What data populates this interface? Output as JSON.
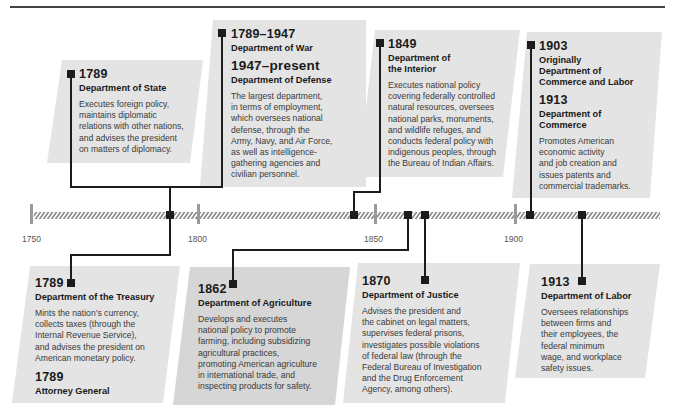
{
  "timeline": {
    "start_year": 1750,
    "ticks": [
      {
        "label": "1750",
        "x": 31
      },
      {
        "label": "1800",
        "x": 198
      },
      {
        "label": "1850",
        "x": 375
      },
      {
        "label": "1900",
        "x": 515
      }
    ],
    "markers": [
      {
        "year": 1789,
        "x": 170
      },
      {
        "year": 1849,
        "x": 354
      },
      {
        "year": 1862,
        "x": 408
      },
      {
        "year": 1870,
        "x": 425
      },
      {
        "year": 1903,
        "x": 530
      },
      {
        "year": 1913,
        "x": 582
      }
    ],
    "colors": {
      "card_light": "#e4e4e4",
      "card_dark": "#d6d6d6",
      "line": "#1c1c1c",
      "tick": "#9a9a9a",
      "hatch": "#8a8a8a"
    }
  },
  "cards": {
    "state": {
      "year": "1789",
      "dept": "Department of State",
      "desc": [
        "Executes foreign policy,",
        "maintains diplomatic",
        "relations with other nations,",
        "and advises the president",
        "on matters of diplomacy."
      ]
    },
    "defense": {
      "year1": "1789–1947",
      "dept1": "Department of War",
      "year2": "1947–present",
      "dept2": "Department of Defense",
      "desc": [
        "The largest department,",
        "in terms of employment,",
        "which oversees national",
        "defense, through the",
        "Army, Navy, and Air Force,",
        "as well as intelligence-",
        "gathering agencies and",
        "civilian personnel."
      ]
    },
    "interior": {
      "year": "1849",
      "dept": [
        "Department of",
        "the Interior"
      ],
      "desc": [
        "Executes national policy",
        "covering federally controlled",
        "natural resources, oversees",
        "national parks, monuments,",
        "and wildlife refuges, and",
        "conducts federal policy with",
        "indigenous peoples, through",
        "the Bureau of Indian Affairs."
      ]
    },
    "commerce": {
      "year1": "1903",
      "dept1": [
        "Originally",
        "Department of",
        "Commerce and Labor"
      ],
      "year2": "1913",
      "dept2": [
        "Department of",
        "Commerce"
      ],
      "desc": [
        "Promotes American",
        "economic activity",
        "and job creation and",
        "issues patents and",
        "commercial trademarks."
      ]
    },
    "treasury": {
      "year": "1789",
      "dept": "Department of the Treasury",
      "desc": [
        "Mints the nation’s currency,",
        "collects taxes (through the",
        "Internal Revenue Service),",
        "and advises the president on",
        "American monetary policy."
      ],
      "year2": "1789",
      "dept2": "Attorney General"
    },
    "agriculture": {
      "year": "1862",
      "dept": "Department of Agriculture",
      "desc": [
        "Develops and executes",
        "national policy to promote",
        "farming, including subsidizing",
        "agricultural practices,",
        "promoting American agriculture",
        "in international trade, and",
        "inspecting products for safety."
      ]
    },
    "justice": {
      "year": "1870",
      "dept": "Department of Justice",
      "desc": [
        "Advises the president and",
        "the cabinet on legal matters,",
        "supervises federal prisons,",
        "investigates possible violations",
        "of federal law (through the",
        "Federal Bureau of Investigation",
        "and the Drug Enforcement",
        "Agency, among others)."
      ]
    },
    "labor": {
      "year": "1913",
      "dept": "Department of Labor",
      "desc": [
        "Oversees relationships",
        "between firms and",
        "their employees, the",
        "federal minimum",
        "wage, and workplace",
        "safety issues."
      ]
    }
  }
}
